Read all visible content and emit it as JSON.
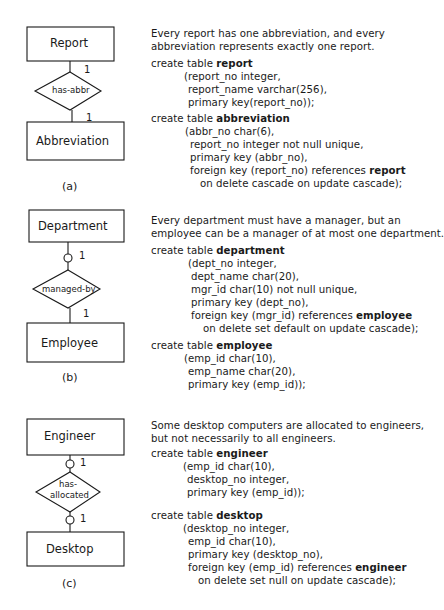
{
  "sections": [
    {
      "caption": "(a)",
      "diagram": {
        "entity_top": "Report",
        "relationship": "has-abbr",
        "entity_bottom": "Abbreviation",
        "card_top": "1",
        "card_bottom": "1",
        "optional_top": false,
        "optional_bottom": false
      },
      "description": [
        "Every report has one abbreviation, and every",
        "abbreviation represents exactly one report."
      ],
      "tables": [
        {
          "prefix": "create table ",
          "name": "report",
          "lines": [
            "(report_no integer,",
            "report_name varchar(256),",
            "primary key(report_no));"
          ]
        },
        {
          "prefix": "create table ",
          "name": "abbreviation",
          "lines": [
            "(abbr_no char(6),",
            "report_no integer not null unique,",
            "primary key (abbr_no),"
          ],
          "fk_line": {
            "text": "foreign key (report_no) references ",
            "ref": "report"
          },
          "tail": "on delete cascade on update cascade);"
        }
      ]
    },
    {
      "caption": "(b)",
      "diagram": {
        "entity_top": "Department",
        "relationship": "managed-by",
        "entity_bottom": "Employee",
        "card_top": "1",
        "card_bottom": "1",
        "optional_top": true,
        "optional_bottom": false
      },
      "description": [
        "Every department must have a manager, but an",
        "employee can be a manager of at most one department."
      ],
      "tables": [
        {
          "prefix": "create table ",
          "name": "department",
          "lines": [
            "(dept_no integer,",
            "dept_name char(20),",
            "mgr_id char(10) not null unique,",
            "primary key (dept_no),"
          ],
          "fk_line": {
            "text": "foreign key (mgr_id) references ",
            "ref": "employee"
          },
          "tail": "on delete set default on update cascade);"
        },
        {
          "prefix": "create table ",
          "name": "employee",
          "lines": [
            "(emp_id char(10),",
            "emp_name char(20),",
            "primary key (emp_id));"
          ]
        }
      ]
    },
    {
      "caption": "(c)",
      "diagram": {
        "entity_top": "Engineer",
        "relationship_line1": "has-",
        "relationship_line2": "allocated",
        "entity_bottom": "Desktop",
        "card_top": "1",
        "card_bottom": "1",
        "optional_top": true,
        "optional_bottom": true
      },
      "description": [
        "Some desktop computers are allocated to engineers,",
        "but not necessarily to all engineers."
      ],
      "tables": [
        {
          "prefix": "create table ",
          "name": "engineer",
          "lines": [
            "(emp_id char(10),",
            "desktop_no integer,",
            "primary key (emp_id));"
          ]
        },
        {
          "prefix": "create table ",
          "name": "desktop",
          "lines": [
            "(desktop_no integer,",
            "emp_id char(10),",
            "primary key (desktop_no),"
          ],
          "fk_line": {
            "text": "foreign key (emp_id) references ",
            "ref": "engineer"
          },
          "tail": "on delete set null on update cascade);"
        }
      ]
    }
  ]
}
